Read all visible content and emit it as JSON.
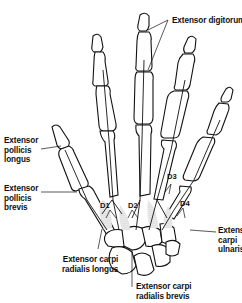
{
  "figure": {
    "labels": {
      "extensor_digitorum": "Extensor digitorum",
      "extensor_pollicis_longus": [
        "Extensor",
        "pollicis",
        "longus"
      ],
      "extensor_pollicis_brevis": [
        "Extensor",
        "pollicis",
        "brevis"
      ],
      "extensor_carpi_radialis_longus": [
        "Extensor carpi",
        "radialis longus"
      ],
      "extensor_carpi_radialis_brevis": [
        "Extensor carpi",
        "radialis brevis"
      ],
      "extensor_carpi_ulnaris": [
        "Extensor",
        "carpi",
        "ulnaris"
      ],
      "d1": "D1",
      "d2": "D2",
      "d3": "D3",
      "d4": "D4"
    }
  }
}
